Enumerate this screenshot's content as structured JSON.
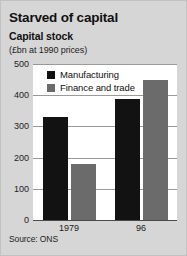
{
  "title": "Starved of capital",
  "subtitle": "Capital stock",
  "units": "(£bn at 1990 prices)",
  "source": "Source: ONS",
  "colors": {
    "manufacturing": "#121212",
    "finance": "#6b6b6b",
    "background": "#d6d6d6",
    "plot_background": "#ffffff",
    "gridline": "#9a9a9a"
  },
  "legend": {
    "position": "inside-top-left",
    "items": [
      {
        "label": "Manufacturing",
        "color": "#121212"
      },
      {
        "label": "Finance and trade",
        "color": "#6b6b6b"
      }
    ]
  },
  "axis": {
    "y_ticks": [
      "500",
      "400",
      "300",
      "200",
      "100",
      "0"
    ],
    "x_ticks": [
      "1979",
      "96"
    ]
  },
  "chart_data": {
    "type": "bar",
    "title": "Starved of capital",
    "subtitle": "Capital stock",
    "xlabel": "",
    "ylabel": "£bn at 1990 prices",
    "ylim": [
      0,
      500
    ],
    "ytick_values": [
      0,
      100,
      200,
      300,
      400,
      500
    ],
    "grid": true,
    "legend_position": "inside-top-left",
    "categories": [
      "1979",
      "96"
    ],
    "series": [
      {
        "name": "Manufacturing",
        "color": "#121212",
        "values": [
          330,
          388
        ]
      },
      {
        "name": "Finance and trade",
        "color": "#6b6b6b",
        "values": [
          178,
          450
        ]
      }
    ],
    "source": "Source: ONS"
  }
}
